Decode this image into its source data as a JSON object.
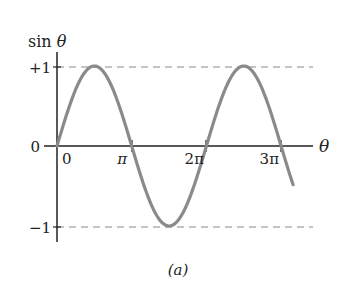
{
  "chart_data": {
    "type": "line",
    "title": "",
    "ylabel": "sin θ",
    "xlabel": "θ",
    "caption": "(a)",
    "y_ticks": [
      {
        "value": 1,
        "label": "+1"
      },
      {
        "value": 0,
        "label": "0"
      },
      {
        "value": -1,
        "label": "−1"
      }
    ],
    "x_ticks": [
      {
        "value": 0,
        "label": "0"
      },
      {
        "value": 3.14159,
        "label": "π"
      },
      {
        "value": 6.28319,
        "label": "2π"
      },
      {
        "value": 9.42478,
        "label": "3π"
      }
    ],
    "xlim": [
      0,
      10.0
    ],
    "ylim": [
      -1,
      1
    ],
    "series": [
      {
        "name": "sin θ",
        "function": "sin",
        "x_start": 0,
        "x_end": 9.93,
        "color": "#8a8a8a"
      }
    ],
    "reference_lines": [
      {
        "y": 1,
        "style": "dashed",
        "color": "#8a8a8a"
      },
      {
        "y": -1,
        "style": "dashed",
        "color": "#8a8a8a"
      }
    ],
    "grid": false,
    "legend": "none"
  }
}
